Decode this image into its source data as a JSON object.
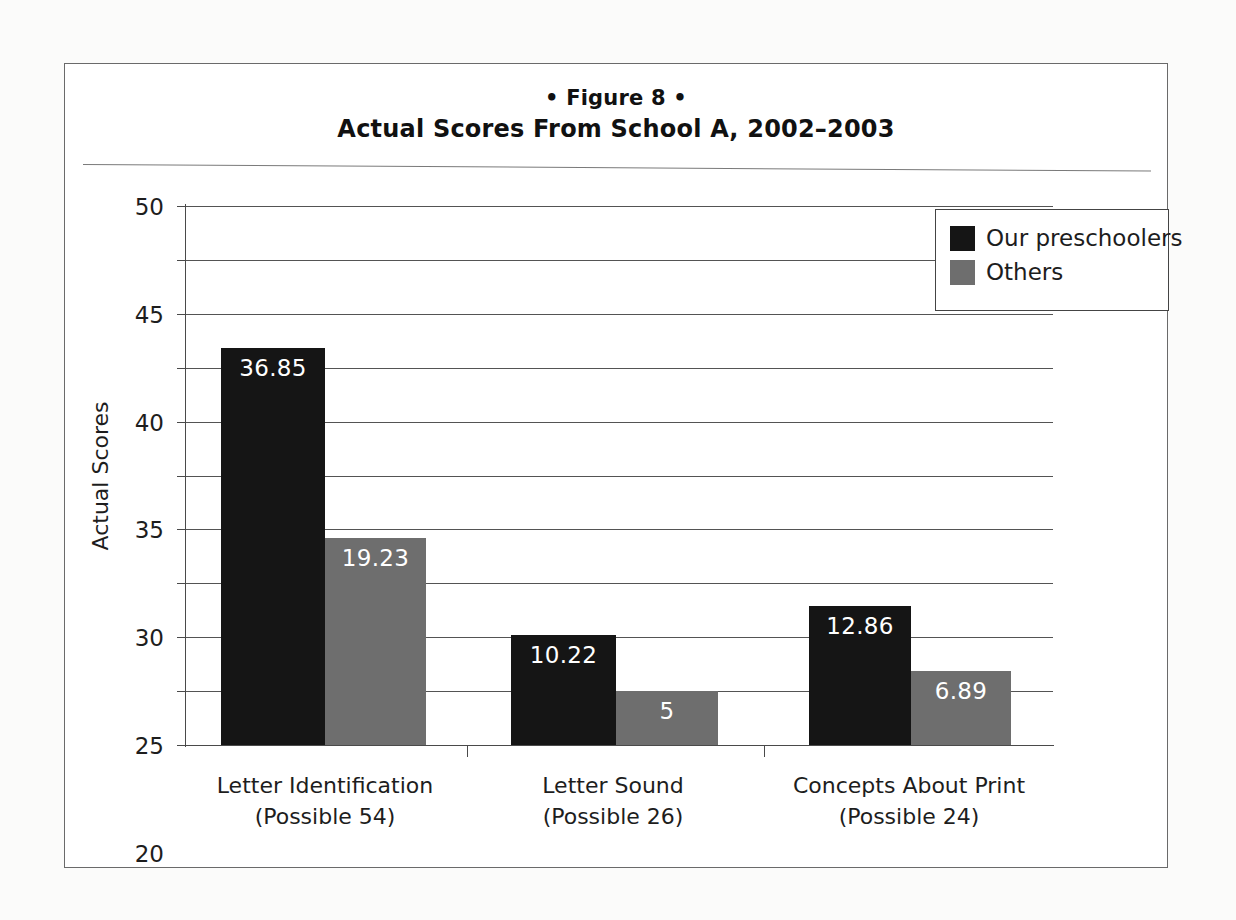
{
  "figure": {
    "label": "• Figure 8 •",
    "title": "Actual Scores From School A, 2002–2003"
  },
  "legend": {
    "position": "top-right",
    "items": [
      {
        "label": "Our preschoolers",
        "color": "#151515",
        "swatch": "dark-square-icon"
      },
      {
        "label": "Others",
        "color": "#6e6e6e",
        "swatch": "gray-square-icon"
      }
    ]
  },
  "axes": {
    "y_title": "Actual Scores",
    "y_ticks": [
      "0",
      "5",
      "10",
      "15",
      "20",
      "25",
      "30",
      "35",
      "40",
      "45",
      "50"
    ],
    "y_min": 0,
    "y_max": 50,
    "y_step": 5
  },
  "categories": [
    {
      "line1": "Letter Identification",
      "line2": "(Possible 54)"
    },
    {
      "line1": "Letter Sound",
      "line2": "(Possible 26)"
    },
    {
      "line1": "Concepts About Print",
      "line2": "(Possible 24)"
    }
  ],
  "bar_labels": {
    "g0s0": "36.85",
    "g0s1": "19.23",
    "g1s0": "10.22",
    "g1s1": "5",
    "g2s0": "12.86",
    "g2s1": "6.89"
  },
  "chart_data": {
    "type": "bar",
    "title": "Actual Scores From School A, 2002–2003",
    "subtitle": "• Figure 8 •",
    "xlabel": "",
    "ylabel": "Actual Scores",
    "ylim": [
      0,
      50
    ],
    "ytick_step": 5,
    "grid": true,
    "legend_position": "top-right",
    "categories": [
      "Letter Identification (Possible 54)",
      "Letter Sound (Possible 26)",
      "Concepts About Print (Possible 24)"
    ],
    "series": [
      {
        "name": "Our preschoolers",
        "color": "#151515",
        "values": [
          36.85,
          10.22,
          12.86
        ]
      },
      {
        "name": "Others",
        "color": "#6e6e6e",
        "values": [
          19.23,
          5,
          6.89
        ]
      }
    ],
    "data_labels": [
      [
        "36.85",
        "10.22",
        "12.86"
      ],
      [
        "19.23",
        "5",
        "6.89"
      ]
    ]
  }
}
